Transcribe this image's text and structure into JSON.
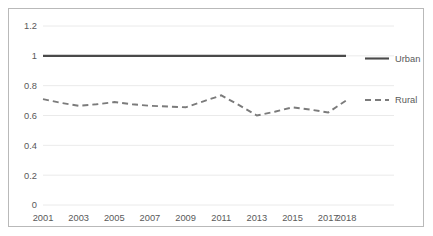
{
  "chart_data": {
    "type": "line",
    "title": "",
    "subtitle": "",
    "xlabel": "",
    "ylabel": "",
    "grid": true,
    "legend_position": "right",
    "x": [
      2001,
      2002,
      2003,
      2004,
      2005,
      2006,
      2007,
      2008,
      2009,
      2010,
      2011,
      2012,
      2013,
      2014,
      2015,
      2016,
      2017,
      2018
    ],
    "categories": [
      "2001",
      "2002",
      "2003",
      "2004",
      "2005",
      "2006",
      "2007",
      "2008",
      "2009",
      "2010",
      "2011",
      "2012",
      "2013",
      "2014",
      "2015",
      "2016",
      "2017",
      "2018"
    ],
    "xtick_labels": [
      "2001",
      "2003",
      "2005",
      "2007",
      "2009",
      "2011",
      "2013",
      "2015",
      "2017",
      "2018"
    ],
    "ytick_labels": [
      "0",
      "0.2",
      "0.4",
      "0.6",
      "0.8",
      "1",
      "1.2"
    ],
    "ytick_values": [
      0,
      0.2,
      0.4,
      0.6,
      0.8,
      1,
      1.2
    ],
    "ylim": [
      0,
      1.2
    ],
    "series": [
      {
        "name": "Urban",
        "style": "solid",
        "color": "#4a4a4a",
        "values": [
          1,
          1,
          1,
          1,
          1,
          1,
          1,
          1,
          1,
          1,
          1,
          1,
          1,
          1,
          1,
          1,
          1,
          1
        ]
      },
      {
        "name": "Rural",
        "style": "dashed",
        "color": "#7b7b7b",
        "values": [
          0.71,
          0.685,
          0.665,
          0.675,
          0.69,
          0.675,
          0.665,
          0.66,
          0.655,
          0.695,
          0.735,
          0.67,
          0.6,
          0.625,
          0.655,
          0.64,
          0.62,
          0.7
        ]
      }
    ]
  },
  "legend": {
    "entries": [
      {
        "label": "Urban"
      },
      {
        "label": "Rural"
      }
    ]
  }
}
